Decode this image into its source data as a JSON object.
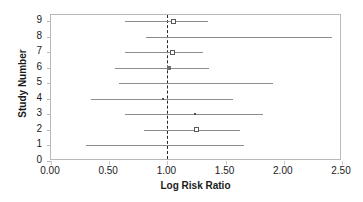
{
  "chart_data": {
    "type": "scatter",
    "subtype": "forest-plot",
    "title": "",
    "xlabel": "Log Risk Ratio",
    "ylabel": "Study Number",
    "xlim": [
      0.0,
      2.5
    ],
    "ylim": [
      0,
      9.4
    ],
    "grid": false,
    "legend": null,
    "reference_line": 1.0,
    "reference_line_style": "dashed",
    "x_ticks": [
      0.0,
      0.5,
      1.0,
      1.5,
      2.0,
      2.5
    ],
    "x_tick_labels": [
      "0.00",
      "0.50",
      "1.00",
      "1.50",
      "2.00",
      "2.50"
    ],
    "y_ticks": [
      0,
      1,
      2,
      3,
      4,
      5,
      6,
      7,
      8,
      9
    ],
    "y_tick_labels": [
      "0",
      "1",
      "2",
      "3",
      "4",
      "5",
      "6",
      "7",
      "8",
      "9"
    ],
    "series": [
      {
        "name": "Study estimates with 95% confidence intervals",
        "points": [
          {
            "study": 9,
            "estimate": 1.05,
            "ci_low": 0.64,
            "ci_high": 1.35,
            "marker": "open-square"
          },
          {
            "study": 8,
            "estimate": 1.05,
            "ci_low": 0.82,
            "ci_high": 2.41,
            "marker": "none"
          },
          {
            "study": 7,
            "estimate": 1.04,
            "ci_low": 0.64,
            "ci_high": 1.31,
            "marker": "open-square"
          },
          {
            "study": 6,
            "estimate": 1.01,
            "ci_low": 0.55,
            "ci_high": 1.36,
            "marker": "filled-square"
          },
          {
            "study": 5,
            "estimate": 1.0,
            "ci_low": 0.58,
            "ci_high": 1.91,
            "marker": "none"
          },
          {
            "study": 4,
            "estimate": 0.96,
            "ci_low": 0.34,
            "ci_high": 1.56,
            "marker": "tiny-square"
          },
          {
            "study": 3,
            "estimate": 1.24,
            "ci_low": 0.64,
            "ci_high": 1.82,
            "marker": "tiny-square"
          },
          {
            "study": 2,
            "estimate": 1.25,
            "ci_low": 0.8,
            "ci_high": 1.62,
            "marker": "open-square"
          },
          {
            "study": 1,
            "estimate": null,
            "ci_low": 0.3,
            "ci_high": 1.66,
            "marker": "none"
          }
        ]
      }
    ],
    "colors": {
      "ci_line": "#8c8c8c",
      "marker_edge": "#595959",
      "reference_line": "#262626",
      "frame": "#b9b9b9",
      "text": "#1a1a1a",
      "background": "#ffffff"
    }
  }
}
